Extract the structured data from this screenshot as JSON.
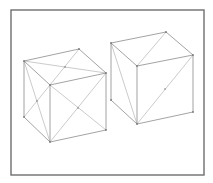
{
  "figure": {
    "frame": {
      "x": 11,
      "y": 10,
      "width": 193,
      "height": 165,
      "stroke": "#6e6e6e"
    },
    "colors": {
      "edge": "#8c8c8c",
      "diagonal": "#b4b4b4",
      "background": "#ffffff"
    },
    "cubes": [
      {
        "name": "left-cube",
        "vertices": {
          "top_back_left": [
            24,
            61
          ],
          "top_back_right": [
            79,
            49
          ],
          "top_front_right": [
            106,
            73
          ],
          "top_front_left": [
            50,
            85
          ],
          "bottom_front_left": [
            50,
            142
          ],
          "bottom_front_right": [
            106,
            130
          ],
          "bottom_back_left": [
            24,
            117
          ]
        },
        "diagonals": [
          [
            [
              24,
              61
            ],
            [
              106,
              73
            ]
          ],
          [
            [
              79,
              49
            ],
            [
              50,
              85
            ]
          ],
          [
            [
              50,
              85
            ],
            [
              106,
              130
            ]
          ],
          [
            [
              106,
              73
            ],
            [
              50,
              142
            ]
          ],
          [
            [
              24,
              61
            ],
            [
              50,
              142
            ]
          ],
          [
            [
              24,
              117
            ],
            [
              50,
              85
            ]
          ]
        ],
        "centers": [
          [
            65,
            67
          ],
          [
            78,
            108
          ],
          [
            37,
            101
          ]
        ]
      },
      {
        "name": "right-cube",
        "vertices": {
          "top_back_left": [
            111,
            43
          ],
          "top_back_right": [
            166,
            32
          ],
          "top_front_right": [
            193,
            55
          ],
          "top_front_left": [
            137,
            66
          ],
          "bottom_front_left": [
            137,
            124
          ],
          "bottom_front_right": [
            193,
            112
          ],
          "bottom_back_left": [
            111,
            100
          ]
        },
        "diagonals": [
          [
            [
              166,
              32
            ],
            [
              137,
              66
            ]
          ],
          [
            [
              193,
              55
            ],
            [
              137,
              124
            ]
          ],
          [
            [
              111,
              43
            ],
            [
              137,
              124
            ]
          ]
        ],
        "centers": [
          [
            165,
            89
          ]
        ]
      }
    ]
  }
}
